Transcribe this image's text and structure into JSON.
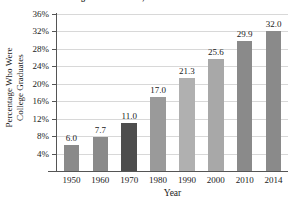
{
  "chart_data": {
    "type": "bar",
    "title": "Aged 25 and Older, in the United States",
    "xlabel": "Year",
    "ylabel": "Percentage Who Were College Graduates",
    "ylabel_lines": [
      "Percentage Who Were",
      "College Graduates"
    ],
    "categories": [
      "1950",
      "1960",
      "1970",
      "1980",
      "1990",
      "2000",
      "2010",
      "2014"
    ],
    "values": [
      6.0,
      7.7,
      11.0,
      17.0,
      21.3,
      25.6,
      29.9,
      32.0
    ],
    "value_labels": [
      "6.0",
      "7.7",
      "11.0",
      "17.0",
      "21.3",
      "25.6",
      "29.9",
      "32.0"
    ],
    "ylim": [
      0,
      36
    ],
    "yticks": [
      4,
      8,
      12,
      16,
      20,
      24,
      28,
      32,
      36
    ],
    "ytick_labels": [
      "4%",
      "8%",
      "12%",
      "16%",
      "20%",
      "24%",
      "28%",
      "32%",
      "36%"
    ],
    "grid": true,
    "legend": "none",
    "bar_colors": [
      "#8a8a8a",
      "#8a8a8a",
      "#4d4d4d",
      "#9a9a9a",
      "#b0b0b0",
      "#a8a8a8",
      "#8a8a8a",
      "#8a8a8a"
    ],
    "gridline_color": "#d8d8d8",
    "axis_color": "#555555",
    "text_color": "#1a1a1a"
  }
}
